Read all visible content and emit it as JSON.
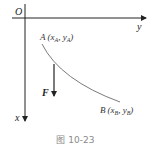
{
  "diagram": {
    "origin_label": "O",
    "y_axis_label": "y",
    "x_axis_label": "x",
    "point_a": {
      "name": "A",
      "coords": "(x",
      "sub1": "A",
      "sep": ", y",
      "sub2": "A",
      "close": ")"
    },
    "point_b": {
      "name": "B",
      "coords": "(x",
      "sub1": "B",
      "sep": ", y",
      "sub2": "B",
      "close": ")"
    },
    "force_label": "F",
    "curve_color": "#7a7a7a",
    "axis_color": "#222222"
  },
  "caption": "图 10-23"
}
